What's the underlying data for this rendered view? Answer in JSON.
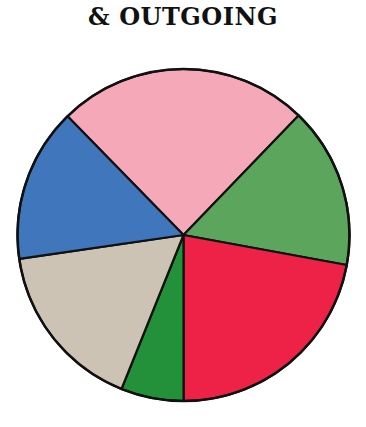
{
  "chart_data": {
    "type": "pie",
    "title": "& OUTGOING",
    "start_angle_deg": 315.7,
    "direction": "clockwise",
    "legend": "none",
    "slices": [
      {
        "label": "Pink segment",
        "value": 24.5,
        "color": "#F5A9B8"
      },
      {
        "label": "Green segment",
        "value": 15.7,
        "color": "#5BA55C"
      },
      {
        "label": "Red segment",
        "value": 22.1,
        "color": "#EE2246"
      },
      {
        "label": "Dark green segment",
        "value": 6.1,
        "color": "#23913A"
      },
      {
        "label": "Beige segment",
        "value": 16.6,
        "color": "#CCC3B5"
      },
      {
        "label": "Blue segment",
        "value": 15.0,
        "color": "#3F76BC"
      }
    ],
    "outline_color": "#111111"
  }
}
